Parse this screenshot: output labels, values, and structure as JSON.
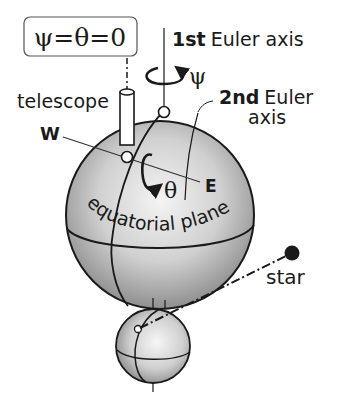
{
  "figure": {
    "type": "euler-angle-telescope-diagram",
    "condition_box": "ψ=θ=0",
    "labels": {
      "telescope": "telescope",
      "west": "W",
      "east": "E",
      "first_axis_bold": "1st",
      "first_axis_rest": "Euler axis",
      "psi": "ψ",
      "second_axis_bold": "2nd",
      "second_axis_rest": "Euler",
      "second_axis_line2": "axis",
      "theta": "θ",
      "equatorial_plane": "equatorial plane",
      "star": "star"
    },
    "colors": {
      "ink": "#1a1a1a",
      "sphere_light": "#f2f2f2",
      "sphere_dark": "#8c8c8c",
      "box_border": "#555555"
    }
  }
}
